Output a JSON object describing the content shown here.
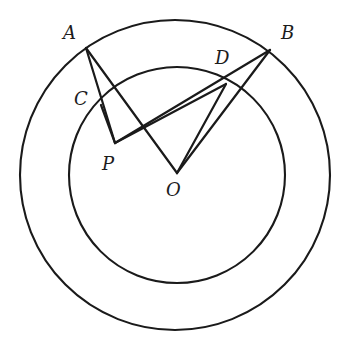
{
  "figure": {
    "background_color": "#ffffff",
    "stroke_color": "#1a1a1a",
    "width": 358,
    "height": 347
  },
  "circles": [
    {
      "name": "outer-circle",
      "center": {
        "x": 175,
        "y": 175
      },
      "radius": 155,
      "stroke_width": 2.1
    },
    {
      "name": "inner-circle",
      "center": {
        "x": 177,
        "y": 175
      },
      "radius": 108,
      "stroke_width": 2.1
    }
  ],
  "points": {
    "A": {
      "label": "A",
      "x": 86,
      "y": 48,
      "label_x": 63,
      "label_y": 24,
      "on": "outer-circle"
    },
    "B": {
      "label": "B",
      "x": 270,
      "y": 50,
      "label_x": 281,
      "label_y": 24,
      "on": "outer-circle"
    },
    "C": {
      "label": "C",
      "x": 101,
      "y": 105,
      "label_x": 74,
      "label_y": 90,
      "on": "inner-circle"
    },
    "D": {
      "label": "D",
      "x": 226,
      "y": 84,
      "label_x": 215,
      "label_y": 49,
      "on": "inner-circle"
    },
    "P": {
      "label": "P",
      "x": 115,
      "y": 143,
      "label_x": 102,
      "label_y": 155,
      "on": "interior"
    },
    "O": {
      "label": "O",
      "x": 177,
      "y": 173,
      "label_x": 166,
      "label_y": 181,
      "on": "center"
    }
  },
  "segments": [
    {
      "name": "segment-A-P",
      "from": "A",
      "to": "P",
      "passes_through": "C"
    },
    {
      "name": "segment-A-O",
      "from": "A",
      "to": "O"
    },
    {
      "name": "segment-B-P",
      "from": "B",
      "to": "P",
      "passes_through": "D"
    },
    {
      "name": "segment-B-O",
      "from": "B",
      "to": "O"
    },
    {
      "name": "segment-O-D",
      "from": "O",
      "to": "D"
    },
    {
      "name": "segment-C-P",
      "from": "C",
      "to": "P"
    },
    {
      "name": "segment-P-D",
      "from": "P",
      "to": "D"
    }
  ],
  "chart_data": {
    "type": "scatter",
    "xlabel": "",
    "ylabel": "",
    "grid": false,
    "legend": "none",
    "annotations": [
      "A",
      "B",
      "C",
      "D",
      "P",
      "O"
    ]
  }
}
